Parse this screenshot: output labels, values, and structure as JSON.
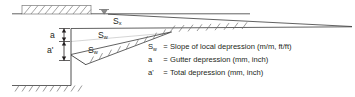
{
  "diagram": {
    "slope_labels": [
      {
        "symbol": "S",
        "subscript": "x",
        "name": "cross-slope-label-top"
      },
      {
        "symbol": "S",
        "subscript": "w",
        "name": "slope-label-middle"
      },
      {
        "symbol": "S",
        "subscript": "w",
        "name": "slope-label-lower"
      }
    ],
    "dimension_labels": [
      {
        "text": "a",
        "name": "gutter-depression-dimension"
      },
      {
        "text": "a'",
        "name": "total-depression-dimension"
      }
    ],
    "water_surface_symbol": "water-level-triangle"
  },
  "legend": {
    "rows": [
      {
        "symbol": "S",
        "subscript": "w",
        "equals": "=",
        "text": "Slope of local depression (m/m, ft/ft)"
      },
      {
        "symbol": "a",
        "subscript": "",
        "equals": "=",
        "text": "Gutter depression (mm, inch)"
      },
      {
        "symbol": "a'",
        "subscript": "",
        "equals": "=",
        "text": "Total depression (mm, inch)"
      }
    ]
  },
  "colors": {
    "line": "#231f20",
    "hatch": "#6f6f6f",
    "background": "#ffffff"
  }
}
